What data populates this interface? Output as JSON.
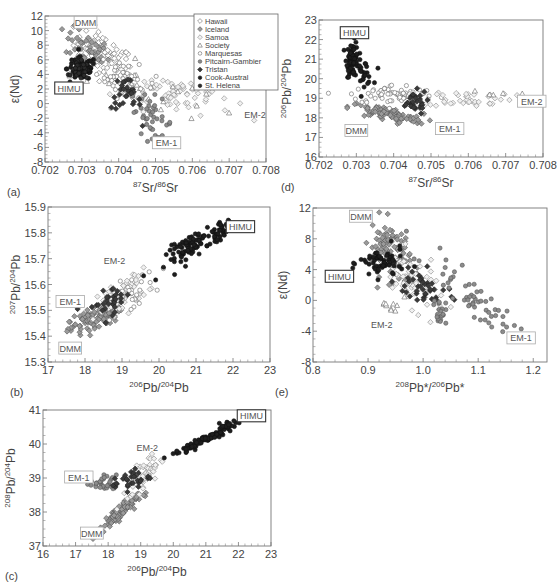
{
  "figure": {
    "legend": {
      "entries": [
        {
          "label": "Hawaii",
          "marker": "diamond-open"
        },
        {
          "label": "Iceland",
          "marker": "diamond-filled-gray"
        },
        {
          "label": "Samoa",
          "marker": "diamond-open-light"
        },
        {
          "label": "Society",
          "marker": "triangle-open"
        },
        {
          "label": "Marquesas",
          "marker": "circle-open"
        },
        {
          "label": "Pitcairn-Gambier",
          "marker": "circle-gray"
        },
        {
          "label": "Tristan",
          "marker": "diamond-dark"
        },
        {
          "label": "Cook-Austral",
          "marker": "circle-black"
        },
        {
          "label": "St. Helena",
          "marker": "circle-dark"
        }
      ]
    }
  },
  "chart_data": [
    {
      "id": "a",
      "panel_label": "(a)",
      "type": "scatter",
      "xlabel": "87Sr/86Sr",
      "ylabel": "ε(Nd)",
      "xlim": [
        0.702,
        0.708
      ],
      "ylim": [
        -8,
        12
      ],
      "xticks": [
        "0.702",
        "0.703",
        "0.704",
        "0.705",
        "0.706",
        "0.707",
        "0.708"
      ],
      "yticks": [
        "12",
        "10",
        "8",
        "6",
        "4",
        "2",
        "0",
        "-2",
        "-4",
        "-6",
        "-8"
      ],
      "frame": {
        "x0": 45,
        "y0": 16,
        "x1": 266,
        "y1": 162
      },
      "legend_position": "upper-right",
      "end_members": [
        {
          "label": "DMM",
          "x": 0.7031,
          "y": 11.0,
          "boxed": true,
          "bold_box": false
        },
        {
          "label": "HIMU",
          "x": 0.70265,
          "y": 2.0,
          "boxed": true,
          "bold_box": true
        },
        {
          "label": "EM-1",
          "x": 0.7053,
          "y": -5.5,
          "boxed": true,
          "bold_box": false
        },
        {
          "label": "EM-2",
          "x": 0.7077,
          "y": -1.6,
          "boxed": false,
          "bold_box": false
        }
      ],
      "clusters": [
        {
          "series": "Hawaii",
          "cx": 0.7036,
          "cy": 6.5,
          "sx": 0.0004,
          "sy": 1.8,
          "n": 90,
          "corr": -0.6,
          "marker": "diamond-open"
        },
        {
          "series": "Iceland",
          "cx": 0.70315,
          "cy": 7.5,
          "sx": 0.0003,
          "sy": 1.3,
          "n": 40,
          "corr": -0.5,
          "marker": "diamond-filled-gray"
        },
        {
          "series": "Samoa",
          "cx": 0.7055,
          "cy": 1.5,
          "sx": 0.0008,
          "sy": 1.4,
          "n": 70,
          "corr": -0.3,
          "marker": "diamond-open-light"
        },
        {
          "series": "Society",
          "cx": 0.7045,
          "cy": 2.5,
          "sx": 0.0009,
          "sy": 2.0,
          "n": 25,
          "corr": -0.6,
          "marker": "triangle-open"
        },
        {
          "series": "Marquesas",
          "cx": 0.7042,
          "cy": 3.0,
          "sx": 0.0004,
          "sy": 1.5,
          "n": 45,
          "corr": -0.5,
          "marker": "circle-open"
        },
        {
          "series": "Pitcairn-Gambier",
          "cx": 0.7049,
          "cy": -1.8,
          "sx": 0.0003,
          "sy": 1.5,
          "n": 40,
          "corr": -0.4,
          "marker": "circle-gray"
        },
        {
          "series": "Tristan",
          "cx": 0.7042,
          "cy": 1.0,
          "sx": 0.0002,
          "sy": 1.3,
          "n": 30,
          "corr": -0.3,
          "marker": "diamond-dark"
        },
        {
          "series": "Cook-Austral",
          "cx": 0.703,
          "cy": 4.8,
          "sx": 0.0002,
          "sy": 0.8,
          "n": 70,
          "corr": 0.0,
          "marker": "circle-black"
        },
        {
          "series": "St. Helena",
          "cx": 0.70295,
          "cy": 4.5,
          "sx": 0.00012,
          "sy": 0.6,
          "n": 35,
          "corr": 0.0,
          "marker": "circle-dark"
        }
      ]
    },
    {
      "id": "d",
      "panel_label": "(d)",
      "type": "scatter",
      "xlabel": "87Sr/86Sr",
      "ylabel": "206Pb/204Pb",
      "xlim": [
        0.702,
        0.708
      ],
      "ylim": [
        16,
        23
      ],
      "xticks": [
        "0.702",
        "0.703",
        "0.704",
        "0.705",
        "0.706",
        "0.707",
        "0.708"
      ],
      "yticks": [
        "23",
        "22",
        "21",
        "20",
        "19",
        "18",
        "17",
        "16"
      ],
      "frame": {
        "x0": 319,
        "y0": 20,
        "x1": 543,
        "y1": 157
      },
      "end_members": [
        {
          "label": "HIMU",
          "x": 0.70295,
          "y": 22.3,
          "boxed": true,
          "bold_box": true
        },
        {
          "label": "DMM",
          "x": 0.703,
          "y": 17.3,
          "boxed": true,
          "bold_box": false
        },
        {
          "label": "EM-1",
          "x": 0.7055,
          "y": 17.4,
          "boxed": true,
          "bold_box": false
        },
        {
          "label": "EM-2",
          "x": 0.7077,
          "y": 18.8,
          "boxed": true,
          "bold_box": false
        }
      ],
      "clusters": [
        {
          "series": "Cook-Austral",
          "cx": 0.7029,
          "cy": 21.0,
          "sx": 8e-05,
          "sy": 0.45,
          "n": 70,
          "corr": 0.0,
          "marker": "circle-black"
        },
        {
          "series": "St. Helena",
          "cx": 0.7032,
          "cy": 20.3,
          "sx": 0.00012,
          "sy": 0.3,
          "n": 25,
          "corr": 0.0,
          "marker": "circle-black"
        },
        {
          "series": "Hawaii",
          "cx": 0.7038,
          "cy": 18.2,
          "sx": 0.0005,
          "sy": 0.25,
          "n": 90,
          "corr": -0.7,
          "marker": "diamond-filled-gray"
        },
        {
          "series": "Marquesas",
          "cx": 0.704,
          "cy": 19.2,
          "sx": 0.0006,
          "sy": 0.25,
          "n": 60,
          "corr": 0.0,
          "marker": "circle-open"
        },
        {
          "series": "Samoa",
          "cx": 0.706,
          "cy": 19.0,
          "sx": 0.0006,
          "sy": 0.2,
          "n": 45,
          "corr": 0.0,
          "marker": "diamond-open-light"
        },
        {
          "series": "Tristan",
          "cx": 0.7045,
          "cy": 18.8,
          "sx": 0.0002,
          "sy": 0.3,
          "n": 30,
          "corr": 0.0,
          "marker": "diamond-dark"
        },
        {
          "series": "Society",
          "cx": 0.7065,
          "cy": 19.2,
          "sx": 0.0004,
          "sy": 0.1,
          "n": 5,
          "corr": 0.0,
          "marker": "triangle-open"
        }
      ]
    },
    {
      "id": "b",
      "panel_label": "(b)",
      "type": "scatter",
      "xlabel": "206Pb/204Pb",
      "ylabel": "207Pb/204Pb",
      "xlim": [
        17,
        23
      ],
      "ylim": [
        15.3,
        15.9
      ],
      "xticks": [
        "17",
        "18",
        "19",
        "20",
        "21",
        "22",
        "23"
      ],
      "yticks": [
        "15.9",
        "15.8",
        "15.7",
        "15.6",
        "15.5",
        "15.4",
        "15.3"
      ],
      "frame": {
        "x0": 48,
        "y0": 207,
        "x1": 270,
        "y1": 362
      },
      "end_members": [
        {
          "label": "HIMU",
          "x": 22.2,
          "y": 15.82,
          "boxed": true,
          "bold_box": true
        },
        {
          "label": "EM-2",
          "x": 18.8,
          "y": 15.69,
          "boxed": false,
          "bold_box": false
        },
        {
          "label": "EM-1",
          "x": 17.6,
          "y": 15.53,
          "boxed": true,
          "bold_box": false
        },
        {
          "label": "DMM",
          "x": 17.6,
          "y": 15.35,
          "boxed": true,
          "bold_box": false
        }
      ],
      "clusters": [
        {
          "series": "Hawaii",
          "cx": 18.3,
          "cy": 15.47,
          "sx": 0.35,
          "sy": 0.035,
          "n": 110,
          "corr": 0.7,
          "marker": "diamond-filled-gray"
        },
        {
          "series": "Samoa",
          "cx": 19.0,
          "cy": 15.56,
          "sx": 0.35,
          "sy": 0.04,
          "n": 70,
          "corr": 0.6,
          "marker": "diamond-open-light"
        },
        {
          "series": "Marquesas",
          "cx": 19.2,
          "cy": 15.56,
          "sx": 0.35,
          "sy": 0.04,
          "n": 30,
          "corr": 0.6,
          "marker": "circle-open"
        },
        {
          "series": "Tristan",
          "cx": 18.7,
          "cy": 15.54,
          "sx": 0.3,
          "sy": 0.03,
          "n": 30,
          "corr": 0.5,
          "marker": "diamond-dark"
        },
        {
          "series": "Cook-Austral",
          "cx": 20.9,
          "cy": 15.75,
          "sx": 0.35,
          "sy": 0.04,
          "n": 80,
          "corr": 0.8,
          "marker": "circle-black"
        },
        {
          "series": "St. Helena",
          "cx": 21.7,
          "cy": 15.81,
          "sx": 0.15,
          "sy": 0.02,
          "n": 30,
          "corr": 0.6,
          "marker": "circle-black"
        }
      ]
    },
    {
      "id": "e",
      "panel_label": "(e)",
      "type": "scatter",
      "xlabel": "208Pb*/206Pb*",
      "ylabel": "ε(Nd)",
      "xlim": [
        0.8,
        1.225
      ],
      "ylim": [
        -8,
        12
      ],
      "xticks": [
        "0.8",
        "0.9",
        "1.0",
        "1.1",
        "1.2"
      ],
      "yticks": [
        "12",
        "8",
        "4",
        "0",
        "-4",
        "-8"
      ],
      "frame": {
        "x0": 313,
        "y0": 208,
        "x1": 547,
        "y1": 362
      },
      "end_members": [
        {
          "label": "DMM",
          "x": 0.887,
          "y": 10.8,
          "boxed": true,
          "bold_box": false
        },
        {
          "label": "HIMU",
          "x": 0.848,
          "y": 3.0,
          "boxed": true,
          "bold_box": true
        },
        {
          "label": "EM-2",
          "x": 0.925,
          "y": -3.2,
          "boxed": false,
          "bold_box": false
        },
        {
          "label": "EM-1",
          "x": 1.178,
          "y": -5.0,
          "boxed": true,
          "bold_box": false
        }
      ],
      "clusters": [
        {
          "series": "Hawaii",
          "cx": 0.94,
          "cy": 6.5,
          "sx": 0.018,
          "sy": 2.0,
          "n": 90,
          "corr": -0.3,
          "marker": "diamond-filled-gray"
        },
        {
          "series": "Samoa",
          "cx": 0.98,
          "cy": 2.5,
          "sx": 0.03,
          "sy": 2.0,
          "n": 60,
          "corr": -0.6,
          "marker": "diamond-open-light"
        },
        {
          "series": "Cook-Austral",
          "cx": 0.925,
          "cy": 4.8,
          "sx": 0.02,
          "sy": 1.0,
          "n": 60,
          "corr": 0.0,
          "marker": "circle-black"
        },
        {
          "series": "Tristan",
          "cx": 1.0,
          "cy": 1.5,
          "sx": 0.025,
          "sy": 1.3,
          "n": 40,
          "corr": -0.4,
          "marker": "diamond-dark"
        },
        {
          "series": "Pitcairn-Gambier",
          "cx": 1.09,
          "cy": 0.5,
          "sx": 0.04,
          "sy": 2.6,
          "n": 55,
          "corr": -0.9,
          "marker": "circle-gray"
        },
        {
          "series": "Pitcairn-Gambier-2",
          "cx": 1.03,
          "cy": -1.5,
          "sx": 0.006,
          "sy": 0.8,
          "n": 20,
          "corr": 0.0,
          "marker": "circle-gray"
        },
        {
          "series": "Society",
          "cx": 0.945,
          "cy": -0.5,
          "sx": 0.01,
          "sy": 0.8,
          "n": 10,
          "corr": 0.0,
          "marker": "triangle-open"
        }
      ]
    },
    {
      "id": "c",
      "panel_label": "(c)",
      "type": "scatter",
      "xlabel": "206Pb/204Pb",
      "ylabel": "208Pb/204Pb",
      "xlim": [
        16,
        23
      ],
      "ylim": [
        37,
        41
      ],
      "xticks": [
        "16",
        "17",
        "18",
        "19",
        "20",
        "21",
        "22",
        "23"
      ],
      "yticks": [
        "41",
        "40",
        "39",
        "38",
        "37"
      ],
      "frame": {
        "x0": 43,
        "y0": 410,
        "x1": 271,
        "y1": 546
      },
      "end_members": [
        {
          "label": "HIMU",
          "x": 22.4,
          "y": 40.8,
          "boxed": true,
          "bold_box": true
        },
        {
          "label": "EM-2",
          "x": 19.2,
          "y": 39.88,
          "boxed": false,
          "bold_box": false
        },
        {
          "label": "EM-1",
          "x": 17.1,
          "y": 39.0,
          "boxed": true,
          "bold_box": false
        },
        {
          "label": "DMM",
          "x": 17.5,
          "y": 37.35,
          "boxed": true,
          "bold_box": false
        }
      ],
      "clusters": [
        {
          "series": "Hawaii",
          "cx": 18.3,
          "cy": 37.95,
          "sx": 0.3,
          "sy": 0.25,
          "n": 100,
          "corr": 0.9,
          "marker": "diamond-filled-gray"
        },
        {
          "series": "Pitcairn-Gambier",
          "cx": 17.85,
          "cy": 38.85,
          "sx": 0.2,
          "sy": 0.12,
          "n": 30,
          "corr": 0.0,
          "marker": "circle-gray"
        },
        {
          "series": "Samoa",
          "cx": 19.1,
          "cy": 39.1,
          "sx": 0.25,
          "sy": 0.3,
          "n": 60,
          "corr": 0.7,
          "marker": "diamond-open-light"
        },
        {
          "series": "Tristan",
          "cx": 18.7,
          "cy": 38.95,
          "sx": 0.3,
          "sy": 0.15,
          "n": 30,
          "corr": 0.3,
          "marker": "diamond-dark"
        },
        {
          "series": "Cook-Austral",
          "cx": 20.9,
          "cy": 40.1,
          "sx": 0.45,
          "sy": 0.22,
          "n": 80,
          "corr": 0.95,
          "marker": "circle-black"
        },
        {
          "series": "St. Helena",
          "cx": 21.7,
          "cy": 40.55,
          "sx": 0.15,
          "sy": 0.08,
          "n": 25,
          "corr": 0.5,
          "marker": "circle-black"
        }
      ]
    }
  ]
}
